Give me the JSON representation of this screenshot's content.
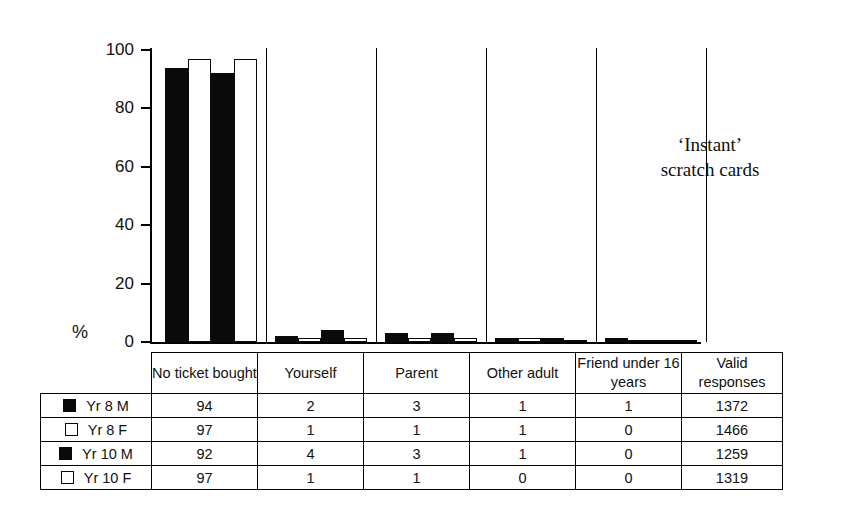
{
  "chart_data": {
    "type": "bar",
    "title": "‘Instant’\nscratch cards",
    "xlabel": "",
    "ylabel": "%",
    "ylim": [
      0,
      100
    ],
    "yticks": [
      0,
      20,
      40,
      60,
      80,
      100
    ],
    "ytick_labels": [
      "0",
      "20",
      "40",
      "60",
      "80",
      "100"
    ],
    "grid": false,
    "legend_position": "table-left",
    "categories": [
      "No ticket bought",
      "Yourself",
      "Parent",
      "Other adult",
      "Friend under 16 years"
    ],
    "series": [
      {
        "name": "Yr 8 M",
        "swatch": "dark",
        "values": [
          94,
          2,
          3,
          1,
          1
        ],
        "valid_responses": 1372
      },
      {
        "name": "Yr 8 F",
        "swatch": "light",
        "values": [
          97,
          1,
          1,
          1,
          0
        ],
        "valid_responses": 1466
      },
      {
        "name": "Yr 10 M",
        "swatch": "dark",
        "values": [
          92,
          4,
          3,
          1,
          0
        ],
        "valid_responses": 1259
      },
      {
        "name": "Yr 10 F",
        "swatch": "light",
        "values": [
          97,
          1,
          1,
          0,
          0
        ],
        "valid_responses": 1319
      }
    ]
  },
  "table": {
    "header": {
      "legend_blank": "",
      "columns": [
        "No ticket bought",
        "Yourself",
        "Parent",
        "Other adult",
        "Friend under 16 years",
        "Valid responses"
      ]
    },
    "rows": [
      {
        "label": "Yr 8 M",
        "swatch": "dark",
        "cells": [
          "94",
          "2",
          "3",
          "1",
          "1",
          "1372"
        ]
      },
      {
        "label": "Yr 8 F",
        "swatch": "light",
        "cells": [
          "97",
          "1",
          "1",
          "1",
          "0",
          "1466"
        ]
      },
      {
        "label": "Yr 10 M",
        "swatch": "dark",
        "cells": [
          "92",
          "4",
          "3",
          "1",
          "0",
          "1259"
        ]
      },
      {
        "label": "Yr 10 F",
        "swatch": "light",
        "cells": [
          "97",
          "1",
          "1",
          "0",
          "0",
          "1319"
        ]
      }
    ]
  },
  "colors": {
    "dark_series": "#0a0a0a",
    "light_series": "#ffffff",
    "axis": "#000000",
    "background": "#ffffff"
  }
}
